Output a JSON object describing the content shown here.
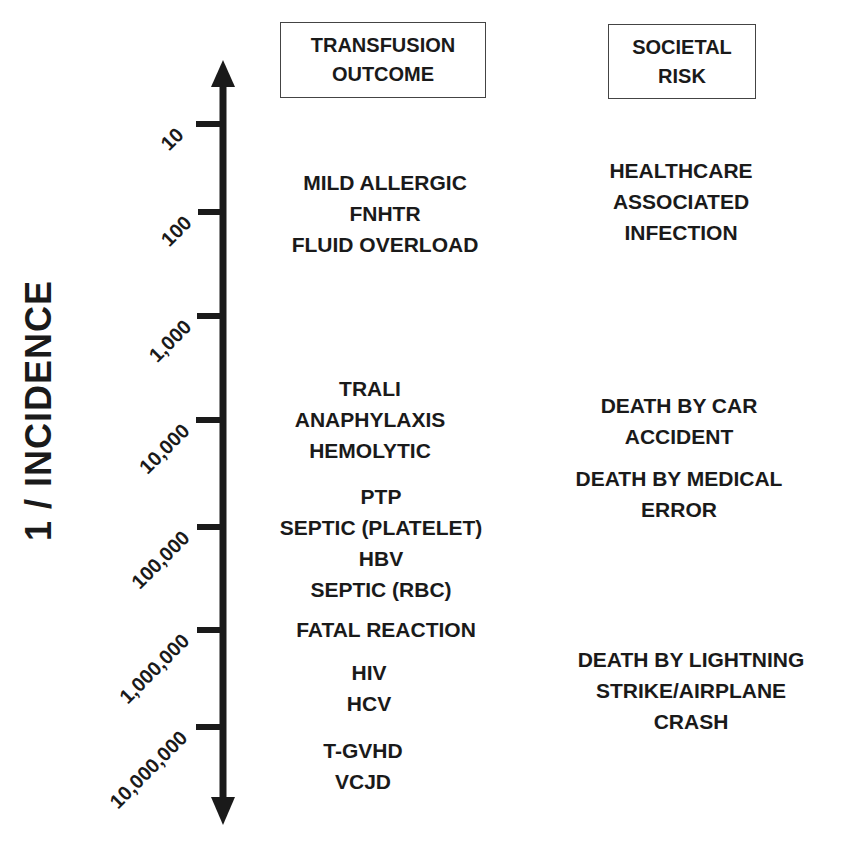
{
  "headers": {
    "transfusion": [
      "TRANSFUSION",
      "OUTCOME"
    ],
    "societal": [
      "SOCIETAL",
      "RISK"
    ]
  },
  "axis": {
    "title": "1 / INCIDENCE",
    "ticks": [
      "10",
      "100",
      "1,000",
      "10,000",
      "100,000",
      "1,000,000",
      "10,000,000"
    ]
  },
  "transfusion_groups": [
    [
      "MILD ALLERGIC",
      "FNHTR",
      "FLUID OVERLOAD"
    ],
    [
      "TRALI",
      "ANAPHYLAXIS",
      "HEMOLYTIC"
    ],
    [
      "PTP",
      "SEPTIC (PLATELET)",
      "HBV",
      "SEPTIC (RBC)"
    ],
    [
      "FATAL REACTION"
    ],
    [
      "HIV",
      "HCV"
    ],
    [
      "T-GVHD",
      "VCJD"
    ]
  ],
  "societal_groups": [
    [
      "HEALTHCARE",
      "ASSOCIATED",
      "INFECTION"
    ],
    [
      "DEATH BY CAR",
      "ACCIDENT"
    ],
    [
      "DEATH BY MEDICAL",
      "ERROR"
    ],
    [
      "DEATH BY LIGHTNING",
      "STRIKE/AIRPLANE",
      "CRASH"
    ]
  ],
  "colors": {
    "ink": "#1a1a1a",
    "box_border": "#444444",
    "background": "#ffffff"
  }
}
